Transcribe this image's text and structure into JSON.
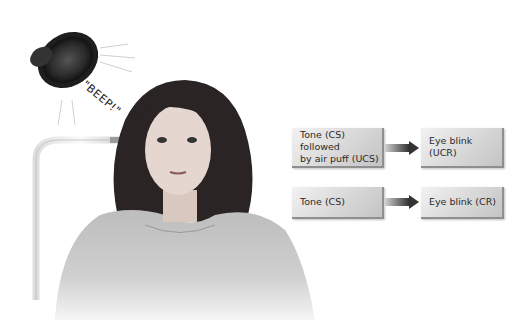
{
  "figure": {
    "sound_label": "\"BEEP!\"",
    "rows": [
      {
        "stimulus": "Tone (CS) followed by air puff (UCS)",
        "stimulus_lines": [
          "Tone (CS) followed",
          "by air puff (UCS)"
        ],
        "response": "Eye blink (UCR)"
      },
      {
        "stimulus": "Tone (CS)",
        "stimulus_lines": [
          "Tone (CS)"
        ],
        "response": "Eye blink (CR)"
      }
    ],
    "icons": [
      "speaker-icon",
      "air-tube-icon",
      "arrow-right-icon"
    ]
  }
}
